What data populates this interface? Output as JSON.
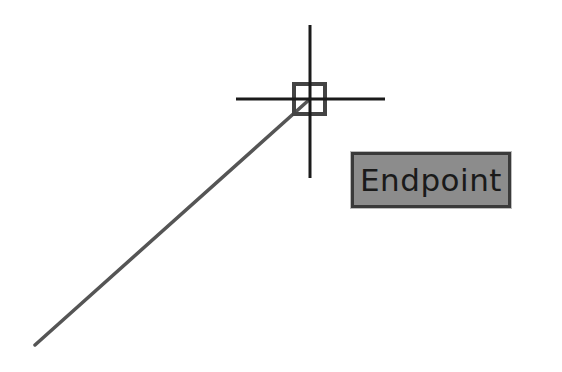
{
  "drawing": {
    "line": {
      "x1": 35,
      "y1": 345,
      "x2": 310,
      "y2": 99,
      "color": "#555555"
    },
    "crosshair": {
      "cx": 310,
      "cy": 99,
      "v_top": 25,
      "v_bottom": 178,
      "h_left": 236,
      "h_right": 385,
      "color": "#1a1a1a"
    },
    "snap_marker": {
      "type": "endpoint-square",
      "x": 293,
      "y": 83,
      "size": 32,
      "color": "#444444"
    }
  },
  "tooltip": {
    "label": "Endpoint",
    "background": "#8c8c8c",
    "border": "#3a3a3a"
  }
}
